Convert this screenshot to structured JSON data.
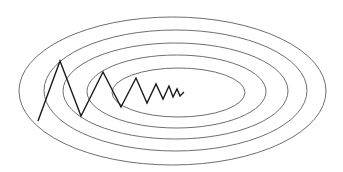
{
  "diagram": {
    "contour_count": 5,
    "contour_color": "#6e6e6e",
    "path_color": "#1a1a1a",
    "contours": [
      {
        "level": 1,
        "label": "outermost contour"
      },
      {
        "level": 2,
        "label": "contour 2"
      },
      {
        "level": 3,
        "label": "contour 3"
      },
      {
        "level": 4,
        "label": "contour 4"
      },
      {
        "level": 5,
        "label": "innermost contour"
      }
    ],
    "descent_steps": 12
  }
}
